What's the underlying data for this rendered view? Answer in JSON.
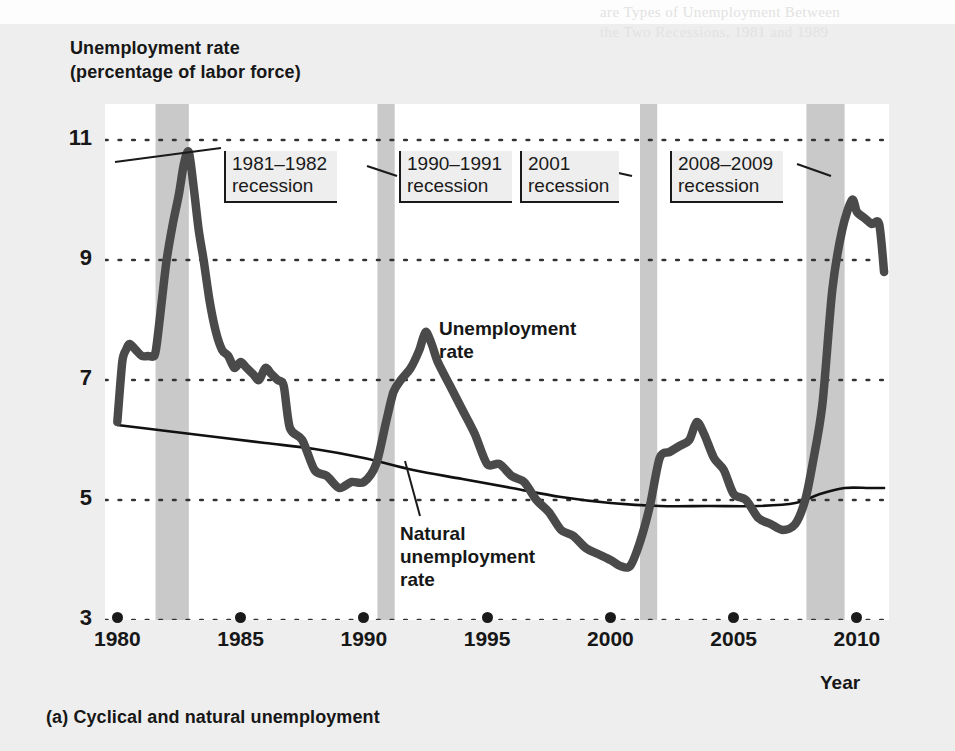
{
  "figure": {
    "axis_title_line1": "Unemployment rate",
    "axis_title_line2": "(percentage of labor force)",
    "caption": "(a) Cyclical and natural unemployment",
    "x_axis_name": "Year",
    "bleed_text_top1": "are Types of Unemployment Between",
    "bleed_text_top2": "the Two Recessions, 1981 and 1989",
    "bleed_text_mid": "Unemployment and Inflation"
  },
  "callouts": [
    {
      "name": "recession-1981-1982",
      "line1": "1981–1982",
      "line2": "recession",
      "left": 224,
      "top": 151
    },
    {
      "name": "recession-1990-1991",
      "line1": "1990–1991",
      "line2": "recession",
      "left": 399,
      "top": 151
    },
    {
      "name": "recession-2001",
      "line1": "2001",
      "line2": "recession",
      "left": 520,
      "top": 151
    },
    {
      "name": "recession-2008-2009",
      "line1": "2008–2009",
      "line2": "recession",
      "left": 670,
      "top": 151
    }
  ],
  "series_labels": {
    "unemployment_l1": "Unemployment",
    "unemployment_l2": "rate",
    "natural_l1": "Natural",
    "natural_l2": "unemployment",
    "natural_l3": "rate"
  },
  "colors": {
    "unemployment_line": "#4a4a4a",
    "natural_line": "#111111",
    "recession_band": "#c9c9c9",
    "gridline": "#333333",
    "page_background": "#eeeeee",
    "plot_background": "#ffffff",
    "text": "#171717"
  },
  "chart_data": {
    "type": "line",
    "title": "Unemployment rate (percentage of labor force)",
    "subtitle": "(a) Cyclical and natural unemployment",
    "xlabel": "Year",
    "ylabel": "Unemployment rate (percentage of labor force)",
    "xlim": [
      1979.5,
      2011.3
    ],
    "ylim": [
      3,
      11.6
    ],
    "yticks": [
      3,
      5,
      7,
      9,
      11
    ],
    "xticks": [
      1980,
      1985,
      1990,
      1995,
      2000,
      2005,
      2010
    ],
    "grid": "horizontal-dotted",
    "legend": "inline-annotations",
    "recession_bands": [
      {
        "label": "1981–1982 recession",
        "start": 1981.55,
        "end": 1982.9
      },
      {
        "label": "1990–1991 recession",
        "start": 1990.55,
        "end": 1991.25
      },
      {
        "label": "2001 recession",
        "start": 2001.2,
        "end": 2001.9
      },
      {
        "label": "2008–2009 recession",
        "start": 2007.95,
        "end": 2009.5
      }
    ],
    "series": [
      {
        "name": "Unemployment rate",
        "color": "#4a4a4a",
        "x": [
          1980.0,
          1980.2,
          1980.35,
          1980.5,
          1980.75,
          1981.0,
          1981.25,
          1981.5,
          1981.6,
          1981.8,
          1982.0,
          1982.25,
          1982.5,
          1982.7,
          1982.9,
          1983.1,
          1983.3,
          1983.5,
          1983.75,
          1984.0,
          1984.25,
          1984.5,
          1984.75,
          1985.0,
          1985.25,
          1985.5,
          1985.75,
          1986.0,
          1986.25,
          1986.5,
          1986.75,
          1987.0,
          1987.5,
          1988.0,
          1988.5,
          1989.0,
          1989.5,
          1990.0,
          1990.5,
          1990.9,
          1991.2,
          1991.5,
          1991.9,
          1992.25,
          1992.5,
          1992.75,
          1993.0,
          1993.5,
          1994.0,
          1994.5,
          1995.0,
          1995.5,
          1996.0,
          1996.5,
          1997.0,
          1997.5,
          1998.0,
          1998.5,
          1999.0,
          1999.5,
          2000.0,
          2000.4,
          2000.8,
          2001.2,
          2001.6,
          2002.0,
          2002.4,
          2002.8,
          2003.2,
          2003.5,
          2003.8,
          2004.2,
          2004.6,
          2005.0,
          2005.5,
          2006.0,
          2006.5,
          2007.0,
          2007.5,
          2007.9,
          2008.2,
          2008.6,
          2009.0,
          2009.4,
          2009.8,
          2010.0,
          2010.3,
          2010.6,
          2010.9,
          2011.1
        ],
        "y": [
          6.3,
          7.3,
          7.5,
          7.6,
          7.5,
          7.4,
          7.4,
          7.4,
          7.6,
          8.3,
          9.0,
          9.6,
          10.1,
          10.6,
          10.8,
          10.2,
          9.5,
          9.0,
          8.3,
          7.8,
          7.5,
          7.4,
          7.2,
          7.3,
          7.2,
          7.1,
          7.0,
          7.2,
          7.1,
          7.0,
          6.9,
          6.2,
          6.0,
          5.5,
          5.4,
          5.2,
          5.3,
          5.3,
          5.6,
          6.3,
          6.8,
          7.0,
          7.2,
          7.5,
          7.8,
          7.6,
          7.3,
          6.9,
          6.5,
          6.1,
          5.6,
          5.6,
          5.4,
          5.3,
          5.0,
          4.8,
          4.5,
          4.4,
          4.2,
          4.1,
          4.0,
          3.9,
          3.9,
          4.3,
          4.9,
          5.7,
          5.8,
          5.9,
          6.0,
          6.3,
          6.1,
          5.7,
          5.5,
          5.1,
          5.0,
          4.7,
          4.6,
          4.5,
          4.6,
          5.0,
          5.6,
          6.6,
          8.5,
          9.5,
          10.0,
          9.8,
          9.7,
          9.6,
          9.6,
          8.8
        ]
      },
      {
        "name": "Natural unemployment rate",
        "color": "#111111",
        "x": [
          1980.0,
          1982.0,
          1984.0,
          1986.0,
          1988.0,
          1990.0,
          1992.0,
          1994.0,
          1996.0,
          1998.0,
          2000.0,
          2002.0,
          2004.0,
          2006.0,
          2007.5,
          2008.5,
          2009.5,
          2010.5,
          2011.1
        ],
        "y": [
          6.25,
          6.15,
          6.05,
          5.95,
          5.85,
          5.7,
          5.5,
          5.35,
          5.2,
          5.05,
          4.95,
          4.9,
          4.9,
          4.9,
          4.95,
          5.1,
          5.2,
          5.2,
          5.2
        ]
      }
    ]
  }
}
